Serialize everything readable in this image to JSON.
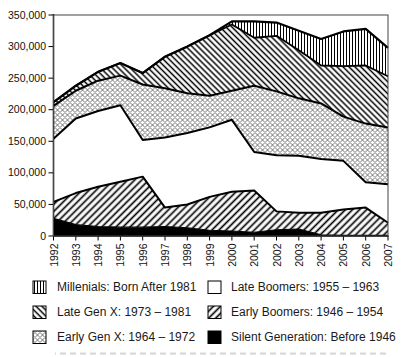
{
  "chart_data": {
    "type": "area",
    "stacked": true,
    "title": "",
    "x": [
      1992,
      1993,
      1994,
      1995,
      1996,
      1997,
      1998,
      1999,
      2000,
      2001,
      2002,
      2003,
      2004,
      2005,
      2006,
      2007
    ],
    "xlabel": "",
    "ylabel": "",
    "ylim": [
      0,
      350000
    ],
    "ytick_step": 50000,
    "ytick_labels": [
      "0",
      "50,000",
      "100,000",
      "150,000",
      "200,000",
      "250,000",
      "300,000",
      "350,000"
    ],
    "grid": false,
    "legend_position": "bottom",
    "x_label_rotation": -90,
    "series": [
      {
        "key": "silent",
        "name": "Silent Generation:  Before 1946",
        "pattern": "solid-black",
        "values": [
          28000,
          18000,
          15000,
          14000,
          14000,
          15000,
          13000,
          9000,
          8000,
          6000,
          10000,
          11000,
          2000,
          1000,
          1000,
          1000
        ]
      },
      {
        "key": "early_boomers",
        "name": "Early Boomers:  1946 – 1954",
        "pattern": "diag-forward",
        "values": [
          26000,
          50000,
          63000,
          72000,
          80000,
          30000,
          37000,
          53000,
          62000,
          66000,
          29000,
          26000,
          35000,
          41000,
          44000,
          20000
        ]
      },
      {
        "key": "late_boomers",
        "name": "Late Boomers:  1955 – 1963",
        "pattern": "white",
        "values": [
          100000,
          118000,
          120000,
          121000,
          58000,
          111000,
          113000,
          110000,
          114000,
          61000,
          89000,
          90000,
          85000,
          77000,
          40000,
          61000
        ]
      },
      {
        "key": "early_genx",
        "name": "Early Gen X: 1964 – 1972",
        "pattern": "diamond",
        "values": [
          52000,
          44000,
          48000,
          47000,
          88000,
          78000,
          63000,
          50000,
          46000,
          105000,
          101000,
          91000,
          88000,
          70000,
          93000,
          90000
        ]
      },
      {
        "key": "late_genx",
        "name": "Late Gen X: 1973 – 1981",
        "pattern": "diag-backward",
        "values": [
          6000,
          8000,
          14000,
          20000,
          18000,
          50000,
          74000,
          96000,
          105000,
          76000,
          88000,
          76000,
          60000,
          80000,
          92000,
          81000
        ]
      },
      {
        "key": "millenials",
        "name": "Millenials: Born After 1981",
        "pattern": "vertical",
        "values": [
          0,
          0,
          0,
          0,
          0,
          0,
          0,
          0,
          5000,
          26000,
          21000,
          31000,
          42000,
          55000,
          58000,
          45000
        ]
      }
    ]
  },
  "legend": {
    "layout": "two-column",
    "left_column_keys": [
      "millenials",
      "late_genx",
      "early_genx"
    ],
    "right_column_keys": [
      "late_boomers",
      "early_boomers",
      "silent"
    ]
  },
  "colors": {
    "ink": "#000000",
    "background": "#ffffff",
    "frame": "#444444"
  }
}
